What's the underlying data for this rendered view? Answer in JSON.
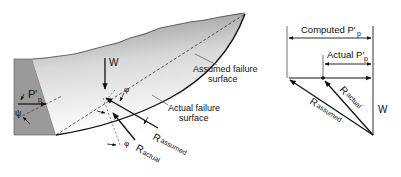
{
  "left_figure": {
    "labels": {
      "weight": "W",
      "passive_force": "P'",
      "passive_sub": "p",
      "wall_angle": "ψ",
      "phi_top": "φ",
      "phi_bottom": "φ",
      "r_assumed": "R",
      "r_assumed_sub": "assumed",
      "r_actual": "R",
      "r_actual_sub": "actual",
      "assumed_surface_line1": "Assumed failure",
      "assumed_surface_line2": "surface",
      "actual_surface_line1": "Actual failure",
      "actual_surface_line2": "surface"
    }
  },
  "right_figure": {
    "labels": {
      "computed": "Computed P'",
      "computed_sub": "p",
      "actual": "Actual P'",
      "actual_sub": "p",
      "r_actual": "R",
      "r_actual_sub": "actual",
      "r_assumed": "R",
      "r_assumed_sub": "assumed",
      "weight": "W"
    }
  },
  "colors": {
    "wall": "#9a9a9a",
    "soil_dark": "#8c8c8c",
    "line": "#111111"
  }
}
